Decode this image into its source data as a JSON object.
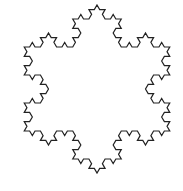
{
  "figure": {
    "type": "koch-snowflake",
    "iterations": 3,
    "center": [
      97,
      89
    ],
    "radius": 84,
    "stroke_color": "#222222",
    "fill_color": "#ffffff",
    "stroke_width": 1.2,
    "background": "#ffffff"
  }
}
